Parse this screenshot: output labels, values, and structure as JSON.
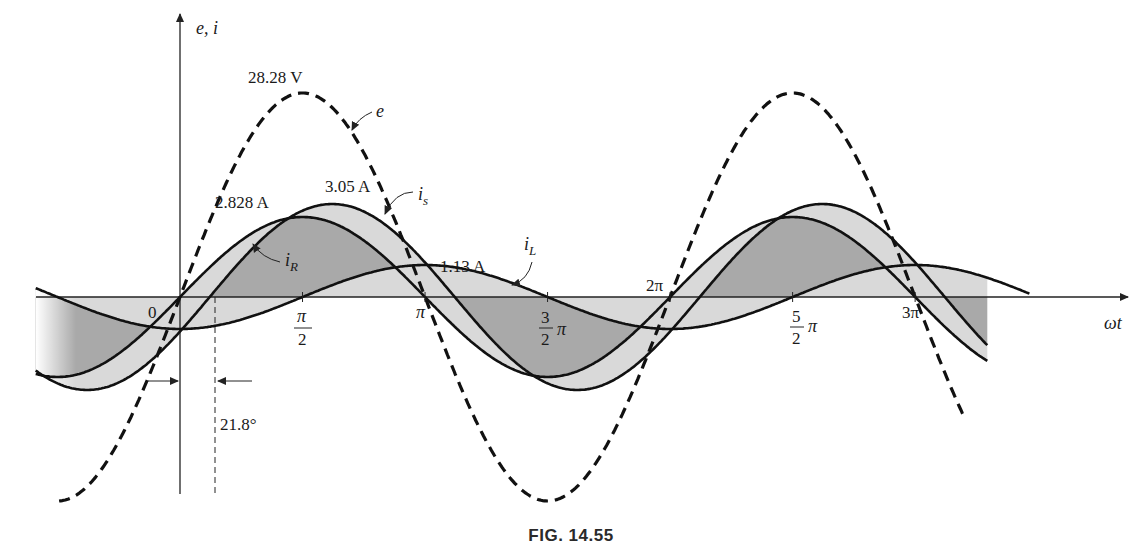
{
  "chart_data": {
    "type": "line",
    "title": "",
    "caption": "FIG. 14.55",
    "xlabel": "ωt",
    "ylabel": "e, i",
    "x_ticks": [
      {
        "value": 0,
        "label": "0"
      },
      {
        "value": 1.5708,
        "label": "π/2"
      },
      {
        "value": 3.1416,
        "label": "π"
      },
      {
        "value": 4.7124,
        "label": "3/2 π"
      },
      {
        "value": 6.2832,
        "label": "2π"
      },
      {
        "value": 7.854,
        "label": "5/2 π"
      },
      {
        "value": 9.4248,
        "label": "3π"
      }
    ],
    "xlim": [
      -1.9,
      11.0
    ],
    "grid": false,
    "legend": "none",
    "series": [
      {
        "name": "e",
        "kind": "sine",
        "peak": 28.28,
        "peak_label": "28.28 V",
        "phase_deg": 0,
        "style": "dashed",
        "unit": "V"
      },
      {
        "name": "i_R",
        "kind": "sine",
        "peak": 2.828,
        "peak_label": "2.828 A",
        "phase_deg": 0,
        "style": "solid",
        "unit": "A"
      },
      {
        "name": "i_L",
        "kind": "sine",
        "peak": 1.13,
        "peak_label": "1.13 A",
        "phase_deg": -90,
        "style": "solid",
        "unit": "A"
      },
      {
        "name": "i_s",
        "kind": "sine",
        "peak": 3.05,
        "peak_label": "3.05 A",
        "phase_deg": -21.8,
        "style": "solid",
        "unit": "A"
      }
    ],
    "annotations": [
      {
        "text": "21.8°",
        "type": "phase-shift",
        "between": [
          "i_R",
          "i_s"
        ]
      },
      {
        "text": "e",
        "points_to": "e"
      },
      {
        "text": "i_s",
        "points_to": "i_s"
      },
      {
        "text": "i_R",
        "points_to": "i_R"
      },
      {
        "text": "i_L",
        "points_to": "i_L"
      }
    ]
  },
  "labels": {
    "y_axis": "e, i",
    "x_axis": "ωt",
    "origin": "0",
    "e_peak": "28.28 V",
    "iR_peak": "2.828 A",
    "is_peak": "3.05 A",
    "iL_peak": "1.13 A",
    "phase": "21.8°",
    "e_name": "e",
    "is_name": "i",
    "is_sub": "s",
    "iR_name": "i",
    "iR_sub": "R",
    "iL_name": "i",
    "iL_sub": "L",
    "pi": "π",
    "two_pi": "2π",
    "three_pi": "3π",
    "num_pi": "π",
    "den_2": "2",
    "num_3": "3",
    "num_5": "5"
  },
  "layout": {
    "origin_x": 180,
    "axis_y": 297,
    "px_per_rad": 78,
    "e_amp_px": 204,
    "iR_amp_px": 80,
    "iL_amp_px": 32,
    "is_amp_px": 93,
    "colors": {
      "curve": "#111111",
      "fill_dark": "#a9a9a9",
      "fill_light": "#d9d9d9",
      "axis": "#222222"
    }
  },
  "caption": "FIG. 14.55"
}
